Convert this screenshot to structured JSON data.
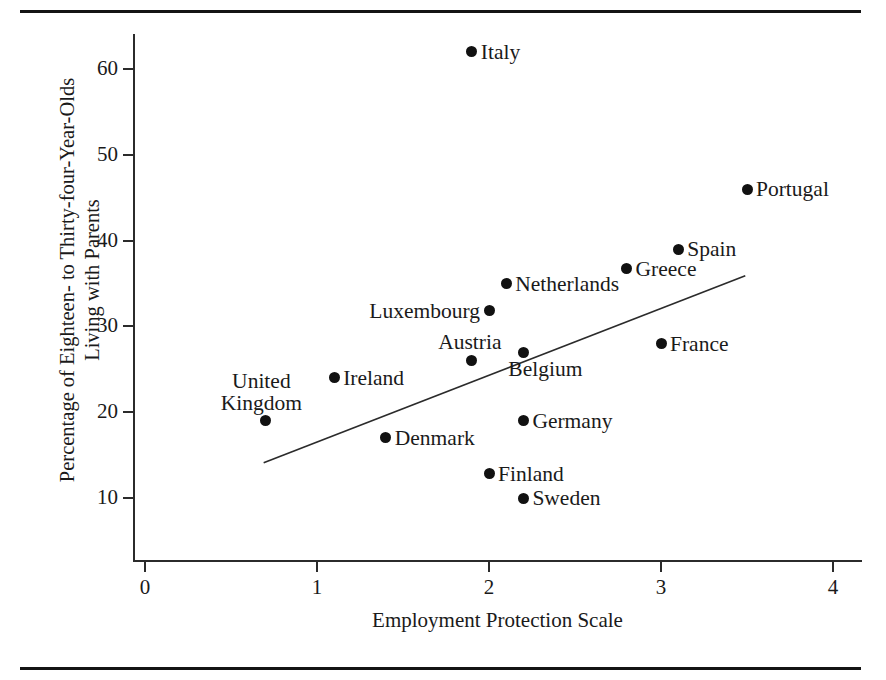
{
  "figure": {
    "top_rule": "horizontal-rule",
    "bottom_rule": "horizontal-rule"
  },
  "chart_data": {
    "type": "scatter",
    "title": "",
    "xlabel": "Employment Protection Scale",
    "ylabel_line1": "Percentage of Eighteen- to Thirty-four-Year-Olds",
    "ylabel_line2": "Living with Parents",
    "xlim": [
      -0.08,
      4.2
    ],
    "ylim": [
      6.8,
      66
    ],
    "xticks": [
      0,
      1,
      2,
      3,
      4
    ],
    "xtick_labels": [
      "0",
      "1",
      "2",
      "3",
      "4"
    ],
    "yticks": [
      10,
      20,
      30,
      40,
      50,
      60
    ],
    "ytick_labels": [
      "10",
      "20",
      "30",
      "40",
      "50",
      "60"
    ],
    "grid": false,
    "legend": "none",
    "marker_color": "#111111",
    "axis_color": "#2b2b2b",
    "points": [
      {
        "label": "Italy",
        "x": 1.9,
        "y": 62.0,
        "label_pos": "right"
      },
      {
        "label": "Portugal",
        "x": 3.5,
        "y": 46.0,
        "label_pos": "right"
      },
      {
        "label": "Spain",
        "x": 3.1,
        "y": 39.0,
        "label_pos": "right"
      },
      {
        "label": "Greece",
        "x": 2.8,
        "y": 36.7,
        "label_pos": "right"
      },
      {
        "label": "Netherlands",
        "x": 2.1,
        "y": 35.0,
        "label_pos": "right"
      },
      {
        "label": "Luxembourg",
        "x": 2.0,
        "y": 31.8,
        "label_pos": "left"
      },
      {
        "label": "France",
        "x": 3.0,
        "y": 28.0,
        "label_pos": "right"
      },
      {
        "label": "Belgium",
        "x": 2.2,
        "y": 27.0,
        "label_pos": "below"
      },
      {
        "label": "Austria",
        "x": 1.9,
        "y": 26.0,
        "label_pos": "above"
      },
      {
        "label": "Ireland",
        "x": 1.1,
        "y": 24.0,
        "label_pos": "right"
      },
      {
        "label": "United Kingdom",
        "x": 0.7,
        "y": 19.0,
        "label_pos": "above"
      },
      {
        "label": "Germany",
        "x": 2.2,
        "y": 19.0,
        "label_pos": "right"
      },
      {
        "label": "Denmark",
        "x": 1.4,
        "y": 17.0,
        "label_pos": "right"
      },
      {
        "label": "Finland",
        "x": 2.0,
        "y": 12.8,
        "label_pos": "right"
      },
      {
        "label": "Sweden",
        "x": 2.2,
        "y": 10.0,
        "label_pos": "right"
      }
    ],
    "trendline": {
      "name": "fit-line",
      "x1": 0.69,
      "y1": 14.1,
      "x2": 3.49,
      "y2": 35.9,
      "color": "#2b2b2b",
      "width": 1.6
    }
  }
}
